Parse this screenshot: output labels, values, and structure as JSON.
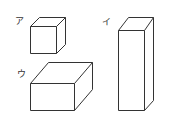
{
  "figure": {
    "shapes": [
      {
        "label": "ア",
        "type": "cube"
      },
      {
        "label": "イ",
        "type": "tall-rectangular-prism"
      },
      {
        "label": "ウ",
        "type": "wide-rectangular-prism"
      }
    ],
    "stroke_color": "#333333",
    "background": "#ffffff"
  }
}
